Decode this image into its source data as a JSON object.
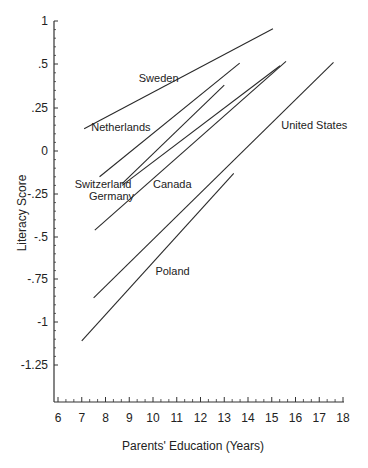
{
  "chart_data": {
    "type": "line",
    "title": "",
    "xlabel": "Parents' Education (Years)",
    "ylabel": "Literacy Score",
    "xlim": [
      6,
      18
    ],
    "x_ticks": [
      "6",
      "7",
      "8",
      "9",
      "10",
      "11",
      "12",
      "13",
      "14",
      "15",
      "16",
      "17",
      "18"
    ],
    "y_ticks": [
      "1",
      ".5",
      ".25",
      "0",
      "-.25",
      "-.5",
      "-.75",
      "-1",
      "-1.25"
    ],
    "grid": false,
    "legend": "none (direct labels)",
    "series": [
      {
        "name": "Sweden",
        "x": [
          7.1,
          15.05
        ],
        "y": [
          0.13,
          0.91
        ],
        "label_pos": [
          9.4,
          0.42
        ]
      },
      {
        "name": "Netherlands",
        "x": [
          7.75,
          13.65
        ],
        "y": [
          -0.15,
          0.51
        ],
        "label_pos": [
          7.4,
          0.14
        ]
      },
      {
        "name": "Switzerland",
        "x": [
          8.7,
          13.0
        ],
        "y": [
          -0.19,
          0.38
        ],
        "label_pos": [
          6.7,
          -0.19
        ]
      },
      {
        "name": "Germany",
        "x": [
          8.7,
          15.35
        ],
        "y": [
          -0.2,
          0.49
        ],
        "label_pos": [
          7.3,
          -0.26
        ]
      },
      {
        "name": "Canada",
        "x": [
          7.55,
          15.6
        ],
        "y": [
          -0.46,
          0.53
        ],
        "label_pos": [
          10.0,
          -0.19
        ]
      },
      {
        "name": "United States",
        "x": [
          7.5,
          17.6
        ],
        "y": [
          -0.86,
          0.52
        ],
        "label_pos": [
          15.4,
          0.15
        ]
      },
      {
        "name": "Poland",
        "x": [
          7.0,
          13.4
        ],
        "y": [
          -1.11,
          -0.13
        ],
        "label_pos": [
          10.1,
          -0.7
        ]
      }
    ]
  }
}
